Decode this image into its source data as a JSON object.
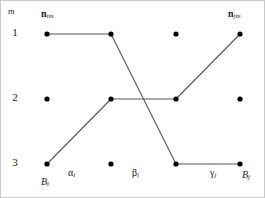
{
  "figure": {
    "background_color": "#ffffff",
    "border_color": "#c8c8c8",
    "node_color": "#000000",
    "edge_color": "#555555"
  },
  "axis": {
    "label": "m",
    "row_labels": [
      "1",
      "2",
      "3"
    ]
  },
  "top_labels": {
    "left": {
      "symbol": "n",
      "subscript": "im"
    },
    "right": {
      "symbol": "n",
      "subscript": "jm"
    }
  },
  "bottom_labels": {
    "start": {
      "symbol": "B",
      "subscript": "i"
    },
    "alpha": {
      "symbol": "α",
      "subscript": "i"
    },
    "beta": {
      "symbol": "β",
      "subscript": "i"
    },
    "gamma": {
      "symbol": "γ",
      "subscript": "j"
    },
    "end": {
      "symbol": "B",
      "subscript": "j"
    }
  },
  "chart_data": {
    "type": "line",
    "xlabel": "",
    "ylabel": "m",
    "grid": false,
    "legend": "none",
    "columns_x": [
      46,
      110,
      175,
      239
    ],
    "rows_y": [
      33,
      98,
      163
    ],
    "row_values": [
      1,
      2,
      3
    ],
    "nodes": [
      {
        "col": 0,
        "row": 1,
        "x": 46,
        "y": 33
      },
      {
        "col": 1,
        "row": 1,
        "x": 110,
        "y": 33
      },
      {
        "col": 2,
        "row": 1,
        "x": 175,
        "y": 33
      },
      {
        "col": 3,
        "row": 1,
        "x": 239,
        "y": 33
      },
      {
        "col": 0,
        "row": 2,
        "x": 46,
        "y": 98
      },
      {
        "col": 1,
        "row": 2,
        "x": 110,
        "y": 98
      },
      {
        "col": 2,
        "row": 2,
        "x": 175,
        "y": 98
      },
      {
        "col": 3,
        "row": 2,
        "x": 239,
        "y": 98
      },
      {
        "col": 0,
        "row": 3,
        "x": 46,
        "y": 163
      },
      {
        "col": 1,
        "row": 3,
        "x": 110,
        "y": 163
      },
      {
        "col": 2,
        "row": 3,
        "x": 175,
        "y": 163
      },
      {
        "col": 3,
        "row": 3,
        "x": 239,
        "y": 163
      }
    ],
    "series": [
      {
        "name": "descending-path",
        "points": [
          {
            "x": 46,
            "y": 33,
            "row": 1
          },
          {
            "x": 110,
            "y": 33,
            "row": 1
          },
          {
            "x": 175,
            "y": 163,
            "row": 3
          },
          {
            "x": 239,
            "y": 163,
            "row": 3
          }
        ]
      },
      {
        "name": "ascending-path",
        "points": [
          {
            "x": 46,
            "y": 163,
            "row": 3
          },
          {
            "x": 110,
            "y": 98,
            "row": 2
          },
          {
            "x": 175,
            "y": 98,
            "row": 2
          },
          {
            "x": 239,
            "y": 33,
            "row": 1
          }
        ]
      }
    ]
  }
}
